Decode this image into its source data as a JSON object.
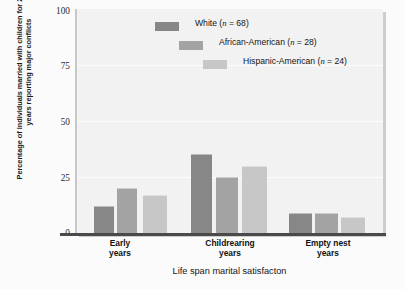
{
  "chart_data": {
    "type": "bar",
    "title": "",
    "xlabel": "Life span marital satisfacton",
    "ylabel": "Percentage of individuals married with children for 20 or more years reporting major conflicts",
    "categories": [
      "Early years",
      "Childrearing years",
      "Empty nest years"
    ],
    "ylim": [
      0,
      100
    ],
    "yticks": [
      "0",
      "25",
      "50",
      "75",
      "100"
    ],
    "grid": true,
    "legend_position": "top-right",
    "series": [
      {
        "name": "White (n = 68)",
        "legend_label_main": "White",
        "legend_label_n": "68",
        "color": "#878787",
        "values": [
          12,
          35,
          9
        ]
      },
      {
        "name": "African-American (n = 28)",
        "legend_label_main": "African-American",
        "legend_label_n": "28",
        "color": "#a3a3a3",
        "values": [
          20,
          25,
          9
        ]
      },
      {
        "name": "Hispanic-American (n = 24)",
        "legend_label_main": "Hispanic-American",
        "legend_label_n": "24",
        "color": "#c7c7c7",
        "values": [
          17,
          30,
          7
        ]
      }
    ]
  },
  "axis": {
    "tick_0": "0",
    "tick_25": "25",
    "tick_50": "50",
    "tick_75": "75",
    "tick_100": "100"
  },
  "group_labels": {
    "early_line1": "Early",
    "early_line2": "years",
    "child_line1": "Childrearing",
    "child_line2": "years",
    "empty_line1": "Empty nest",
    "empty_line2": "years"
  }
}
